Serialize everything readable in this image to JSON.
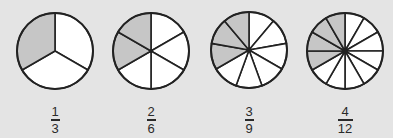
{
  "colors": {
    "background": "#e4e4e4",
    "shaded": "#c6c6c6",
    "unshaded": "#ffffff",
    "stroke": "#222222"
  },
  "circles": [
    {
      "id": "thirds",
      "cx": 55,
      "cy": 51,
      "r": 38,
      "parts": 3,
      "shaded": 1,
      "fraction": {
        "numerator": "1",
        "denominator": "3"
      },
      "label_x": 40,
      "label_w": 30
    },
    {
      "id": "sixths",
      "cx": 151,
      "cy": 51,
      "r": 38,
      "parts": 6,
      "shaded": 2,
      "fraction": {
        "numerator": "2",
        "denominator": "6"
      },
      "label_x": 136,
      "label_w": 30
    },
    {
      "id": "ninths",
      "cx": 249,
      "cy": 50,
      "r": 38,
      "parts": 9,
      "shaded": 3,
      "fraction": {
        "numerator": "3",
        "denominator": "9"
      },
      "label_x": 234,
      "label_w": 30
    },
    {
      "id": "twelfths",
      "cx": 345,
      "cy": 51,
      "r": 38,
      "parts": 12,
      "shaded": 4,
      "fraction": {
        "numerator": "4",
        "denominator": "12"
      },
      "label_x": 330,
      "label_w": 30
    }
  ]
}
